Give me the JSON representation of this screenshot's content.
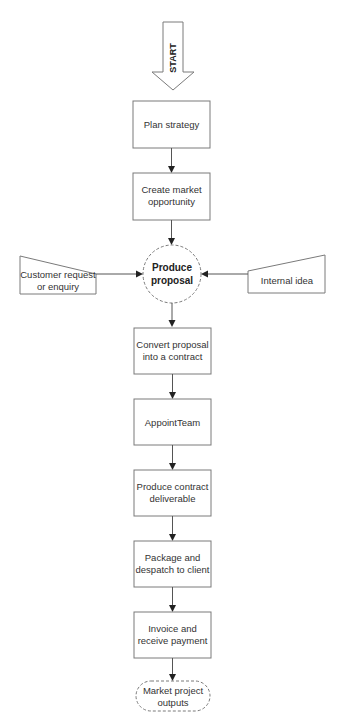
{
  "diagram": {
    "start": {
      "label": "START"
    },
    "steps": [
      {
        "id": "plan",
        "lines": [
          "Plan strategy"
        ]
      },
      {
        "id": "create",
        "lines": [
          "Create market",
          "opportunity"
        ]
      },
      {
        "id": "produce",
        "lines": [
          "Produce",
          "proposal"
        ],
        "shape": "dashed-circle"
      },
      {
        "id": "convert",
        "lines": [
          "Convert proposal",
          "into a contract"
        ]
      },
      {
        "id": "appoint",
        "lines": [
          "AppointTeam"
        ]
      },
      {
        "id": "deliverable",
        "lines": [
          "Produce contract",
          "deliverable"
        ]
      },
      {
        "id": "package",
        "lines": [
          "Package and",
          "despatch to client"
        ]
      },
      {
        "id": "invoice",
        "lines": [
          "Invoice and",
          "receive payment"
        ]
      },
      {
        "id": "market",
        "lines": [
          "Market project",
          "outputs"
        ],
        "shape": "dashed-terminator"
      }
    ],
    "inputs": {
      "left": {
        "lines": [
          "Customer request",
          "or enquiry"
        ]
      },
      "right": {
        "lines": [
          "Internal idea"
        ]
      }
    },
    "colors": {
      "stroke": "#7a7a7a",
      "arrow": "#222222",
      "text": "#333333"
    }
  }
}
